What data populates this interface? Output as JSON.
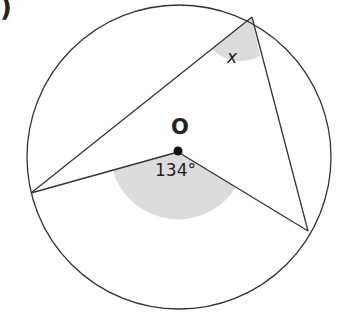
{
  "figure": {
    "part_label": ")",
    "center_label": "O",
    "central_angle_label": "134°",
    "inscribed_angle_label": "x",
    "colors": {
      "stroke": "#333333",
      "shade": "#dcdcdc",
      "background": "#ffffff"
    }
  }
}
